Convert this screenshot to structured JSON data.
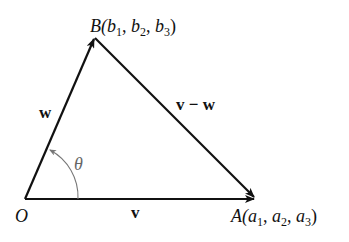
{
  "diagram": {
    "points": {
      "O": {
        "label": "O"
      },
      "A": {
        "name": "A",
        "coords": "(a1, a2, a3)",
        "prefix": "A(",
        "a1": "a",
        "sub1": "1",
        "a2": "a",
        "sub2": "2",
        "a3": "a",
        "sub3": "3"
      },
      "B": {
        "name": "B",
        "prefix": "B(",
        "b": "b",
        "sub1": "1",
        "sub2": "2",
        "sub3": "3"
      }
    },
    "vectors": {
      "v": "v",
      "w": "w",
      "v_minus_w": "v − w"
    },
    "angle": "θ"
  }
}
